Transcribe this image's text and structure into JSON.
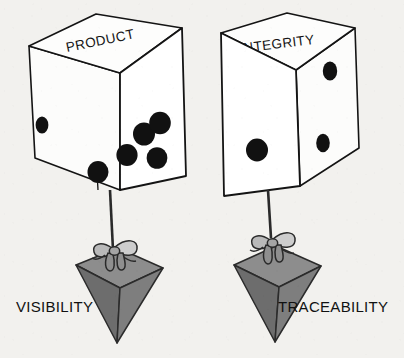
{
  "illustration": {
    "title": "Product Integrity suspended dice and pyramids",
    "background_color": "#f2f1ee",
    "ink_color": "#111111"
  },
  "dice": [
    {
      "id": "product-die",
      "top_face_label": "PRODUCT",
      "top_face_pips": 0,
      "front_face_pips": 5,
      "side_face_pips": 1,
      "side_face_position": "left",
      "body_color": "#ffffff",
      "pip_color": "#111111"
    },
    {
      "id": "integrity-die",
      "top_face_label": "INTEGRITY",
      "top_face_pips": 0,
      "front_face_pips": 1,
      "side_face_pips": 2,
      "side_face_position": "right",
      "body_color": "#ffffff",
      "pip_color": "#111111"
    }
  ],
  "pendants": [
    {
      "id": "visibility-pendant",
      "caption": "VISIBILITY",
      "caption_position": "left",
      "shape": "inverted-pyramid",
      "top_face_color": "#8a8a8a",
      "left_face_color": "#6e6e6e",
      "right_face_color": "#7d7d7d",
      "has_ribbon_bow": true,
      "hangs_from": "product-die"
    },
    {
      "id": "traceability-pendant",
      "caption": "TRACEABILITY",
      "caption_position": "right",
      "shape": "inverted-pyramid",
      "top_face_color": "#8a8a8a",
      "left_face_color": "#6e6e6e",
      "right_face_color": "#7d7d7d",
      "has_ribbon_bow": true,
      "hangs_from": "integrity-die"
    }
  ]
}
